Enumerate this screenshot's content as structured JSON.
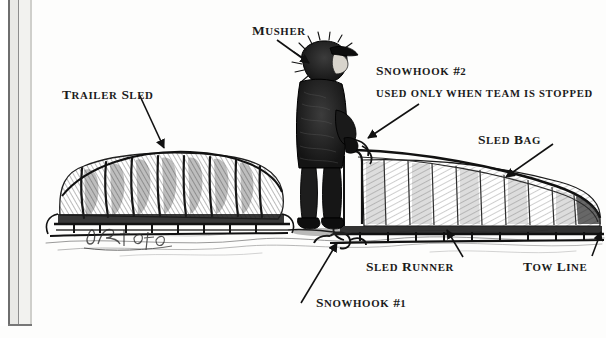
{
  "page": {
    "kind": "book-page-illustration",
    "background_color": "#fdfdfc",
    "ink_color": "#1b1b1b",
    "width": 606,
    "height": 338
  },
  "artwork": {
    "title": "Dog sled rig, pen-and-ink drawing",
    "signature": "Dietz",
    "subject": "A musher standing beside a loaded freight sled with a trailer sled behind"
  },
  "labels": [
    {
      "id": "trailer-sled",
      "text": "TRAILER SLED",
      "x": 62,
      "y": 86,
      "arrow": {
        "x1": 140,
        "y1": 96,
        "x2": 164,
        "y2": 148
      }
    },
    {
      "id": "musher",
      "text": "MUSHER",
      "x": 252,
      "y": 22,
      "arrow": {
        "x1": 277,
        "y1": 40,
        "x2": 309,
        "y2": 63
      }
    },
    {
      "id": "snowhook-2",
      "text": "SNOWHOOK #2",
      "subtext": "USED ONLY WHEN TEAM IS STOPPED",
      "x": 376,
      "y": 62,
      "sub_x": 376,
      "sub_y": 87,
      "arrow": {
        "x1": 419,
        "y1": 104,
        "x2": 368,
        "y2": 138
      }
    },
    {
      "id": "sled-bag",
      "text": "SLED BAG",
      "x": 478,
      "y": 131,
      "arrow": {
        "x1": 553,
        "y1": 144,
        "x2": 506,
        "y2": 177
      }
    },
    {
      "id": "sled-runner",
      "text": "SLED RUNNER",
      "x": 366,
      "y": 258,
      "arrow": {
        "x1": 463,
        "y1": 257,
        "x2": 447,
        "y2": 230
      }
    },
    {
      "id": "tow-line",
      "text": "TOW LINE",
      "x": 523,
      "y": 258,
      "arrow": {
        "x1": 592,
        "y1": 256,
        "x2": 601,
        "y2": 232
      }
    },
    {
      "id": "snowhook-1",
      "text": "SNOWHOOK #1",
      "x": 316,
      "y": 294,
      "arrow": {
        "x1": 301,
        "y1": 303,
        "x2": 337,
        "y2": 243
      }
    }
  ]
}
